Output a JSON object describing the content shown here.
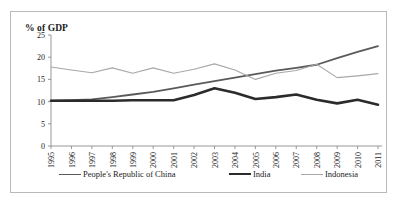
{
  "chart_data": {
    "type": "line",
    "title": "",
    "ylabel": "% of GDP",
    "xlabel": "",
    "ylim": [
      0,
      25
    ],
    "yticks": [
      0,
      5,
      10,
      15,
      20,
      25
    ],
    "grid": false,
    "legend_position": "bottom",
    "categories": [
      "1995",
      "1996",
      "1997",
      "1998",
      "1999",
      "2000",
      "2001",
      "2002",
      "2003",
      "2004",
      "2005",
      "2006",
      "2007",
      "2008",
      "2009",
      "2010",
      "2011"
    ],
    "series": [
      {
        "name": "People's Republic of China",
        "color": "#5a5a5a",
        "width": 1.8,
        "values": [
          10.2,
          10.3,
          10.5,
          11.0,
          11.6,
          12.2,
          13.0,
          13.8,
          14.6,
          15.4,
          16.2,
          17.0,
          17.6,
          18.3,
          19.8,
          21.2,
          22.5
        ]
      },
      {
        "name": "India",
        "color": "#2b2b2b",
        "width": 2.6,
        "values": [
          10.2,
          10.2,
          10.2,
          10.2,
          10.3,
          10.3,
          10.3,
          11.5,
          13.0,
          12.0,
          10.6,
          11.0,
          11.6,
          10.4,
          9.6,
          10.4,
          9.3
        ]
      },
      {
        "name": "Indonesia",
        "color": "#a8a8a8",
        "width": 1.1,
        "values": [
          17.8,
          17.1,
          16.5,
          17.6,
          16.4,
          17.6,
          16.4,
          17.3,
          18.5,
          17.1,
          15.0,
          16.4,
          17.0,
          18.4,
          15.4,
          15.8,
          16.3
        ]
      }
    ]
  },
  "axis": {
    "y_title": "% of GDP"
  },
  "legend": {
    "items": [
      {
        "label": "People's Republic of China",
        "color": "#5a5a5a",
        "width": 1.8
      },
      {
        "label": "India",
        "color": "#2b2b2b",
        "width": 2.8
      },
      {
        "label": "Indonesia",
        "color": "#a8a8a8",
        "width": 1.1
      }
    ]
  }
}
